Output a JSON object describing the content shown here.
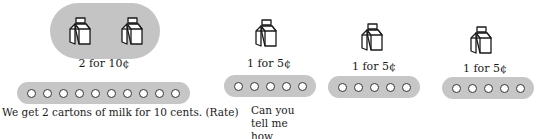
{
  "group_left": {
    "carton_count": 2,
    "price_label": "2 for 10¢",
    "coin_count": 10,
    "caption": "We get 2 cartons of milk for 10 cents. (Rate)"
  },
  "groups_right": [
    {
      "carton_count": 1,
      "price_label": "1 for 5¢",
      "coin_count": 5
    },
    {
      "carton_count": 1,
      "price_label": "1 for 5¢",
      "coin_count": 5
    },
    {
      "carton_count": 1,
      "price_label": "1 for 5¢",
      "coin_count": 5
    }
  ],
  "question": {
    "line1": "Can you tell me how much one carton of milk would",
    "line2": "cost? Three cartons?"
  },
  "colors": {
    "pill_bg": "#c4c4c4",
    "bar_bg": "#c6c6c6",
    "coin_fill": "#ffffff",
    "ink": "#1a1a1a"
  },
  "icons": {
    "carton": "milk-carton-icon",
    "coin": "coin-icon"
  }
}
